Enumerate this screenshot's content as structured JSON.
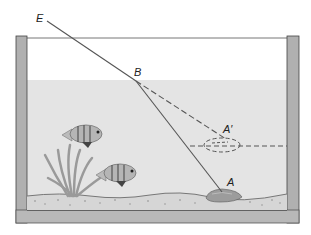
{
  "diagram": {
    "type": "refraction-aquarium",
    "labels": {
      "E": "E",
      "B": "B",
      "A_prime": "A′",
      "A": "A"
    },
    "points": {
      "E": [
        47,
        21
      ],
      "B": [
        136,
        81
      ],
      "A": [
        222,
        192
      ],
      "A_prime": [
        226,
        142
      ]
    },
    "elements": [
      "tank-walls",
      "water-surface",
      "incident-ray E-B (solid)",
      "refracted-ray B-A (solid)",
      "extended-ray B-A' (dashed)",
      "apparent-object A' (dashed ellipse)",
      "horizontal dashed line from A'",
      "rock at A",
      "two fish",
      "seaweed",
      "gravel bottom"
    ],
    "colors": {
      "wall": "#a9a9a9",
      "water": "#e4e4e4",
      "line": "#555555",
      "fish": "#8a8a8a",
      "plant": "#9a9a9a",
      "rock": "#9c9c9c"
    }
  }
}
